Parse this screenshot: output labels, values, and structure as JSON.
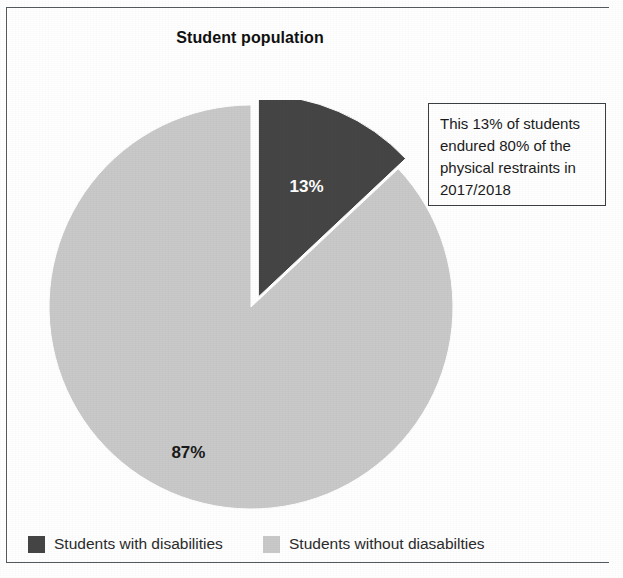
{
  "chart_data": {
    "type": "pie",
    "title": "Student population",
    "categories": [
      "Students with disabilities",
      "Students without diasabilties"
    ],
    "values": [
      13,
      87
    ],
    "value_labels": [
      "13%",
      "87%"
    ],
    "colors": [
      "#454545",
      "#c9c9c9"
    ],
    "exploded": [
      "Students with disabilities"
    ],
    "start_angle_deg": 0,
    "direction": "clockwise",
    "legend_position": "bottom",
    "grid": false,
    "annotation": "This 13% of students endured 80% of the physical restraints in 2017/2018"
  },
  "title": {
    "text": "Student population"
  },
  "slices": {
    "dark": {
      "label": "13%",
      "name": "Students with disabilities",
      "value": 13,
      "color": "#454545",
      "label_color": "#ffffff"
    },
    "light": {
      "label": "87%",
      "name": "Students without diasabilties",
      "value": 87,
      "color": "#c9c9c9",
      "label_color": "#1a1a1a"
    }
  },
  "annotation": {
    "text": "This 13% of students endured 80% of the physical restraints in 2017/2018"
  },
  "legend": {
    "items": [
      {
        "label": "Students with disabilities",
        "color": "#454545"
      },
      {
        "label": "Students without diasabilties",
        "color": "#c9c9c9"
      }
    ]
  }
}
